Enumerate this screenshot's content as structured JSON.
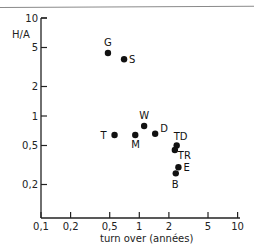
{
  "chart_data": {
    "type": "scatter",
    "title": "",
    "xlabel": "turn over (années)",
    "ylabel": "H/A",
    "xscale": "log",
    "yscale": "log",
    "xlim": [
      0.1,
      10
    ],
    "ylim": [
      0.1,
      10
    ],
    "x_ticks": [
      "0,1",
      "0,2",
      "0,5",
      "1",
      "2",
      "5",
      "10"
    ],
    "y_ticks": [
      "10",
      "5",
      "2",
      "1",
      "0,5",
      "0,2"
    ],
    "grid": false,
    "legend": null,
    "points": [
      {
        "label": "G",
        "x": 0.48,
        "y": 4.4
      },
      {
        "label": "S",
        "x": 0.7,
        "y": 3.8
      },
      {
        "label": "T",
        "x": 0.56,
        "y": 0.64
      },
      {
        "label": "M",
        "x": 0.91,
        "y": 0.64
      },
      {
        "label": "W",
        "x": 1.12,
        "y": 0.79
      },
      {
        "label": "D",
        "x": 1.45,
        "y": 0.66
      },
      {
        "label": "TD",
        "x": 2.4,
        "y": 0.5
      },
      {
        "label": "TR",
        "x": 2.3,
        "y": 0.45
      },
      {
        "label": "E",
        "x": 2.5,
        "y": 0.3
      },
      {
        "label": "B",
        "x": 2.35,
        "y": 0.26
      }
    ]
  }
}
